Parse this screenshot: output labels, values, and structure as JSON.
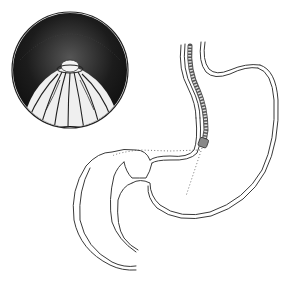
{
  "illustration": {
    "subject": "stomach-with-endoscope",
    "inset": {
      "shape": "circle",
      "view": "endoscopic-view-of-pylorus",
      "center": [
        70,
        70
      ],
      "radius": 58
    },
    "colors": {
      "background": "#ffffff",
      "ink": "#3a3a3a",
      "dark_fill": "#1e1e1e",
      "fold_fill": "#e8e8e8"
    }
  }
}
